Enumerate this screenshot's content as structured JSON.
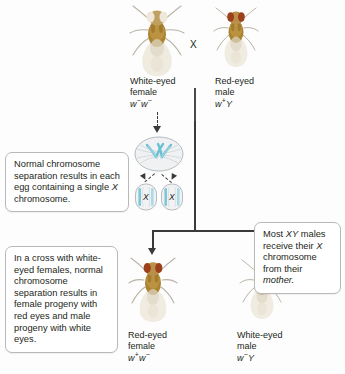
{
  "figure": {
    "cross_symbol": "X",
    "background_color": "#fdfdfd",
    "line_color": "#3a3a3a",
    "chromosome_color": "#7ec8d8"
  },
  "parents": {
    "female": {
      "name_line1": "White-eyed",
      "name_line2": "female",
      "genotype_allele1": "w",
      "genotype_sup1": "−",
      "genotype_allele2": "w",
      "genotype_sup2": "−",
      "eye_color": "#efe7d9"
    },
    "male": {
      "name_line1": "Red-eyed",
      "name_line2": "male",
      "genotype_allele1": "w",
      "genotype_sup1": "+",
      "genotype_allele2": "Y",
      "genotype_sup2": "",
      "eye_color": "#a8431f"
    }
  },
  "offspring": {
    "female": {
      "name_line1": "Red-eyed",
      "name_line2": "female",
      "genotype_allele1": "w",
      "genotype_sup1": "+",
      "genotype_allele2": "w",
      "genotype_sup2": "−",
      "eye_color": "#a8431f"
    },
    "male": {
      "name_line1": "White-eyed",
      "name_line2": "male",
      "genotype_allele1": "w",
      "genotype_sup1": "−",
      "genotype_allele2": "Y",
      "genotype_sup2": "",
      "eye_color": "#efe7d9"
    }
  },
  "meiosis": {
    "egg_label_left": "X",
    "egg_label_right": "X"
  },
  "callouts": {
    "top_left": {
      "text_part1": "Normal chromosome separation results in each egg containing a single ",
      "italic1": "X",
      "text_part2": " chromosome."
    },
    "bottom_left": {
      "text": "In a cross with white-eyed females, normal chromosome separation results in female progeny with red eyes and male progeny with white eyes."
    },
    "bottom_right": {
      "text_part1": "Most ",
      "italic1": "XY",
      "text_part2": " males receive their ",
      "italic2": "X",
      "text_part3": " chromosome from their ",
      "italic3": "mother."
    }
  }
}
